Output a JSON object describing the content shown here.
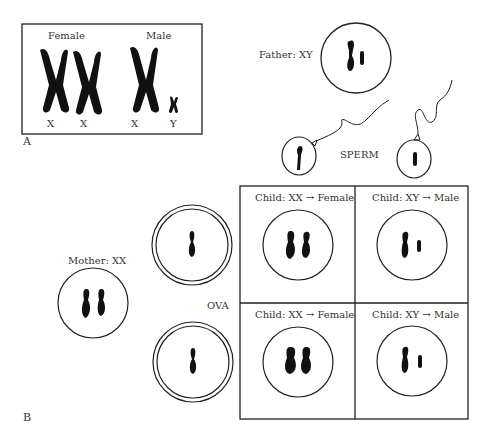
{
  "panel_a": {
    "label": "A",
    "female_label": "Female",
    "male_label": "Male",
    "chromosome_labels": [
      "X",
      "X",
      "X",
      "Y"
    ]
  },
  "panel_b": {
    "label": "B",
    "father_label": "Father: XY",
    "mother_label": "Mother: XX",
    "sperm_label": "SPERM",
    "ova_label": "OVA",
    "punnett": [
      {
        "label": "Child: XX → Female",
        "genotype": "XX"
      },
      {
        "label": "Child: XY → Male",
        "genotype": "XY"
      },
      {
        "label": "Child: XX → Female",
        "genotype": "XX"
      },
      {
        "label": "Child: XY → Male",
        "genotype": "XY"
      }
    ]
  }
}
